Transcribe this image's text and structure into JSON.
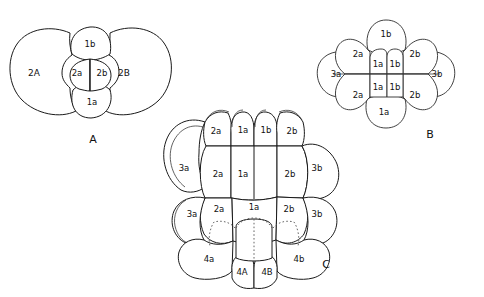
{
  "figure": {
    "caption_labels": [
      "A",
      "B",
      "C"
    ],
    "background_color": "#ffffff",
    "line_color": "#1a1a1a"
  },
  "panels": [
    {
      "id": "A",
      "label": "A",
      "label_x": 93,
      "label_y": 140,
      "cells": [
        {
          "name": "2A",
          "x": 34,
          "y": 73,
          "size": "large"
        },
        {
          "name": "2B",
          "x": 124,
          "y": 73,
          "size": "large"
        },
        {
          "name": "1b",
          "x": 90,
          "y": 44,
          "size": "medium"
        },
        {
          "name": "1a",
          "x": 92,
          "y": 102,
          "size": "medium"
        },
        {
          "name": "2a",
          "x": 76,
          "y": 73,
          "size": "small"
        },
        {
          "name": "2b",
          "x": 101,
          "y": 73,
          "size": "small"
        }
      ]
    },
    {
      "id": "B",
      "label": "B",
      "label_x": 430,
      "label_y": 135,
      "cells": [
        {
          "name": "1b",
          "x": 385,
          "y": 34
        },
        {
          "name": "1a",
          "x": 383,
          "y": 112
        },
        {
          "name": "3a",
          "x": 336,
          "y": 74
        },
        {
          "name": "3b",
          "x": 437,
          "y": 74
        },
        {
          "name": "2a",
          "x": 360,
          "y": 52
        },
        {
          "name": "2a",
          "x": 360,
          "y": 95
        },
        {
          "name": "2b",
          "x": 412,
          "y": 52
        },
        {
          "name": "2b",
          "x": 412,
          "y": 95
        },
        {
          "name": "1a",
          "x": 376,
          "y": 64
        },
        {
          "name": "1b",
          "x": 396,
          "y": 64
        },
        {
          "name": "1a",
          "x": 376,
          "y": 88
        },
        {
          "name": "1b",
          "x": 396,
          "y": 88
        }
      ]
    },
    {
      "id": "C",
      "label": "C",
      "label_x": 326,
      "label_y": 265,
      "cells": [
        {
          "name": "2a",
          "x": 215,
          "y": 131,
          "row": "top"
        },
        {
          "name": "1a",
          "x": 243,
          "y": 130,
          "row": "top"
        },
        {
          "name": "1b",
          "x": 266,
          "y": 130,
          "row": "top"
        },
        {
          "name": "2b",
          "x": 291,
          "y": 131,
          "row": "top"
        },
        {
          "name": "3a",
          "x": 184,
          "y": 168,
          "row": "upper-outer"
        },
        {
          "name": "2a",
          "x": 222,
          "y": 174,
          "row": "upper"
        },
        {
          "name": "1a",
          "x": 253,
          "y": 174,
          "row": "upper"
        },
        {
          "name": "2b",
          "x": 283,
          "y": 174,
          "row": "upper"
        },
        {
          "name": "3b",
          "x": 315,
          "y": 168,
          "row": "upper-outer"
        },
        {
          "name": "3a",
          "x": 194,
          "y": 214,
          "row": "lower-outer"
        },
        {
          "name": "2a",
          "x": 225,
          "y": 209,
          "row": "lower"
        },
        {
          "name": "1a",
          "x": 254,
          "y": 207,
          "row": "lower"
        },
        {
          "name": "2b",
          "x": 283,
          "y": 209,
          "row": "lower"
        },
        {
          "name": "3b",
          "x": 315,
          "y": 214,
          "row": "lower-outer"
        },
        {
          "name": "4a",
          "x": 214,
          "y": 259,
          "row": "bottom"
        },
        {
          "name": "4A",
          "x": 243,
          "y": 272,
          "row": "bottom"
        },
        {
          "name": "4B",
          "x": 268,
          "y": 272,
          "row": "bottom"
        },
        {
          "name": "4b",
          "x": 296,
          "y": 259,
          "row": "bottom"
        }
      ]
    }
  ]
}
